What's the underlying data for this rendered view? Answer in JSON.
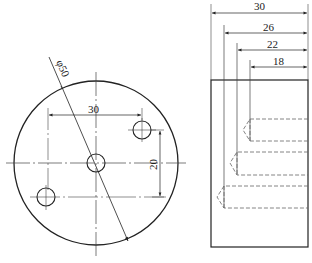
{
  "drawing": {
    "front_view": {
      "outer_diameter_label": "φ50",
      "hole_spacing_horizontal_label": "30",
      "hole_spacing_vertical_label": "20"
    },
    "side_view": {
      "dimensions": [
        "30",
        "26",
        "22",
        "18"
      ]
    }
  }
}
